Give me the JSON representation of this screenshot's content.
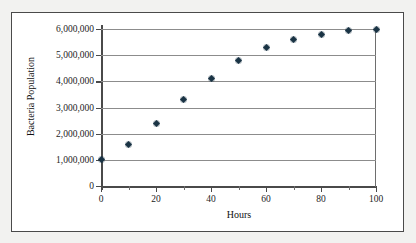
{
  "figure": {
    "frame_border_color": "#4a4a4a",
    "background_color": "#f2f2f0",
    "plot_background_color": "#ffffff",
    "gridline_color": "#8c8c8c",
    "marker_color": "#1a3344"
  },
  "chart_data": {
    "type": "scatter",
    "title": "",
    "xlabel": "Hours",
    "ylabel": "Bacteria Population",
    "xlim": [
      0,
      100
    ],
    "ylim": [
      0,
      6000000
    ],
    "grid": "horizontal",
    "legend": "none",
    "x_ticks": [
      0,
      20,
      40,
      60,
      80,
      100
    ],
    "x_tick_labels": [
      "0",
      "20",
      "40",
      "60",
      "80",
      "100"
    ],
    "x_minor_ticks": [
      10,
      30,
      50,
      70,
      90
    ],
    "y_ticks": [
      0,
      1000000,
      2000000,
      3000000,
      4000000,
      5000000,
      6000000
    ],
    "y_tick_labels": [
      "0",
      "1,000,000",
      "2,000,000",
      "3,000,000",
      "4,000,000",
      "5,000,000",
      "6,000,000"
    ],
    "series": [
      {
        "name": "Bacteria Population",
        "marker": "diamond",
        "x": [
          0,
          10,
          20,
          30,
          40,
          50,
          60,
          70,
          80,
          90,
          100
        ],
        "y": [
          1000000,
          1600000,
          2400000,
          3300000,
          4100000,
          4800000,
          5300000,
          5600000,
          5800000,
          5950000,
          6000000
        ]
      }
    ]
  }
}
